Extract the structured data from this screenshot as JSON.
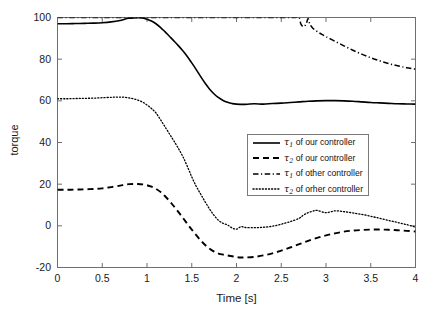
{
  "chart_data": {
    "type": "line",
    "title": "",
    "xlabel": "Time [s]",
    "ylabel": "torque",
    "xlim": [
      0,
      4
    ],
    "ylim": [
      -20,
      100
    ],
    "xticks": [
      "0",
      "0.5",
      "1",
      "1.5",
      "2",
      "2.5",
      "3",
      "3.5",
      "4"
    ],
    "xtick_values": [
      0,
      0.5,
      1,
      1.5,
      2,
      2.5,
      3,
      3.5,
      4
    ],
    "yticks": [
      "-20",
      "0",
      "20",
      "40",
      "60",
      "80",
      "100"
    ],
    "ytick_values": [
      -20,
      0,
      20,
      40,
      60,
      80,
      100
    ],
    "grid": false,
    "legend_position": "center-right",
    "series": [
      {
        "name": "tau1_our",
        "legend_label_prefix": "τ",
        "legend_label_sub": "1",
        "legend_label_rest": " of our controller",
        "style": "solid",
        "color": "#000000",
        "linewidth": 1.6,
        "x": [
          0,
          0.1,
          0.2,
          0.3,
          0.4,
          0.5,
          0.6,
          0.7,
          0.75,
          0.8,
          0.85,
          0.9,
          0.95,
          1.0,
          1.05,
          1.1,
          1.15,
          1.2,
          1.25,
          1.3,
          1.35,
          1.4,
          1.45,
          1.5,
          1.55,
          1.6,
          1.65,
          1.7,
          1.75,
          1.8,
          1.85,
          1.9,
          1.95,
          2.0,
          2.1,
          2.2,
          2.3,
          2.4,
          2.5,
          2.6,
          2.7,
          2.8,
          2.9,
          3.0,
          3.1,
          3.2,
          3.3,
          3.4,
          3.5,
          3.6,
          3.7,
          3.8,
          3.9,
          4.0
        ],
        "y": [
          97.0,
          97.0,
          97.1,
          97.2,
          97.3,
          97.5,
          97.9,
          98.6,
          99.2,
          99.6,
          99.8,
          99.9,
          99.8,
          99.2,
          98.3,
          97.0,
          95.3,
          93.2,
          91.0,
          88.8,
          86.5,
          84.0,
          81.3,
          78.2,
          75.0,
          71.6,
          68.4,
          65.6,
          63.3,
          61.5,
          60.2,
          59.3,
          58.7,
          58.4,
          58.3,
          58.6,
          58.4,
          58.7,
          58.9,
          59.2,
          59.5,
          59.8,
          60.0,
          60.1,
          60.1,
          60.0,
          59.8,
          59.5,
          59.2,
          59.0,
          58.8,
          58.6,
          58.5,
          58.4
        ]
      },
      {
        "name": "tau2_our",
        "legend_label_prefix": "τ",
        "legend_label_sub": "2",
        "legend_label_rest": " of our controller",
        "style": "dashed",
        "color": "#000000",
        "linewidth": 1.9,
        "x": [
          0,
          0.1,
          0.2,
          0.3,
          0.4,
          0.5,
          0.6,
          0.7,
          0.75,
          0.8,
          0.85,
          0.9,
          0.95,
          1.0,
          1.05,
          1.1,
          1.15,
          1.2,
          1.25,
          1.3,
          1.35,
          1.4,
          1.45,
          1.5,
          1.55,
          1.6,
          1.65,
          1.7,
          1.75,
          1.8,
          1.85,
          1.9,
          1.95,
          2.0,
          2.05,
          2.1,
          2.2,
          2.3,
          2.4,
          2.5,
          2.6,
          2.7,
          2.8,
          2.9,
          3.0,
          3.1,
          3.2,
          3.3,
          3.4,
          3.5,
          3.6,
          3.7,
          3.8,
          3.9,
          4.0
        ],
        "y": [
          17.3,
          17.3,
          17.4,
          17.5,
          17.7,
          18.0,
          18.6,
          19.3,
          19.7,
          20.0,
          20.1,
          20.1,
          19.9,
          19.5,
          18.8,
          17.8,
          16.3,
          14.3,
          12.0,
          9.4,
          6.7,
          3.9,
          1.0,
          -1.8,
          -4.5,
          -7.0,
          -9.2,
          -11.0,
          -12.4,
          -13.3,
          -13.8,
          -14.2,
          -14.6,
          -15.0,
          -15.2,
          -15.2,
          -14.9,
          -14.2,
          -13.2,
          -11.9,
          -10.4,
          -8.8,
          -7.2,
          -5.8,
          -4.6,
          -3.6,
          -2.8,
          -2.3,
          -2.0,
          -1.8,
          -1.8,
          -1.9,
          -2.1,
          -2.4,
          -2.7
        ]
      },
      {
        "name": "tau1_other",
        "legend_label_prefix": "τ",
        "legend_label_sub": "1",
        "legend_label_rest": " of other controller",
        "style": "dashdot",
        "color": "#000000",
        "linewidth": 1.5,
        "x": [
          0,
          0.25,
          0.5,
          0.75,
          1.0,
          1.25,
          1.5,
          1.75,
          2.0,
          2.25,
          2.5,
          2.6,
          2.65,
          2.7,
          2.72,
          2.75,
          2.78,
          2.8,
          2.82,
          2.85,
          2.9,
          2.95,
          3.0,
          3.1,
          3.2,
          3.3,
          3.4,
          3.5,
          3.6,
          3.7,
          3.8,
          3.9,
          4.0
        ],
        "y": [
          100.0,
          100.0,
          100.0,
          100.0,
          100.0,
          100.0,
          100.0,
          100.0,
          100.0,
          100.0,
          100.0,
          100.0,
          100.0,
          99.9,
          96.8,
          95.6,
          97.2,
          99.5,
          96.8,
          95.0,
          93.3,
          92.0,
          90.8,
          88.6,
          86.4,
          84.3,
          82.4,
          80.7,
          79.2,
          77.9,
          76.8,
          75.9,
          75.2
        ]
      },
      {
        "name": "tau2_other",
        "legend_label_prefix": "τ",
        "legend_label_sub": "2",
        "legend_label_rest": " of orher controller",
        "style": "dotted",
        "color": "#000000",
        "linewidth": 1.3,
        "x": [
          0,
          0.1,
          0.2,
          0.3,
          0.4,
          0.5,
          0.6,
          0.65,
          0.7,
          0.75,
          0.8,
          0.85,
          0.9,
          0.95,
          1.0,
          1.05,
          1.1,
          1.15,
          1.2,
          1.25,
          1.3,
          1.35,
          1.4,
          1.45,
          1.5,
          1.55,
          1.6,
          1.65,
          1.7,
          1.75,
          1.8,
          1.85,
          1.9,
          1.95,
          2.0,
          2.05,
          2.1,
          2.2,
          2.3,
          2.4,
          2.5,
          2.6,
          2.7,
          2.75,
          2.8,
          2.85,
          2.9,
          3.0,
          3.1,
          3.2,
          3.3,
          3.4,
          3.5,
          3.6,
          3.7,
          3.8,
          3.9,
          4.0
        ],
        "y": [
          61.0,
          61.0,
          61.1,
          61.2,
          61.3,
          61.5,
          61.7,
          61.8,
          61.8,
          61.7,
          61.4,
          61.0,
          60.3,
          59.4,
          58.0,
          56.3,
          54.2,
          51.0,
          47.6,
          44.2,
          40.8,
          37.2,
          33.3,
          28.6,
          23.5,
          19.0,
          15.2,
          11.5,
          8.0,
          5.0,
          2.6,
          1.2,
          0.4,
          -1.0,
          -1.6,
          -0.4,
          -0.8,
          -0.9,
          -0.7,
          -0.2,
          0.8,
          2.0,
          3.6,
          5.2,
          6.3,
          7.0,
          7.4,
          6.3,
          7.2,
          6.8,
          6.2,
          5.5,
          4.6,
          3.6,
          2.6,
          1.6,
          0.6,
          -0.6
        ]
      }
    ]
  }
}
